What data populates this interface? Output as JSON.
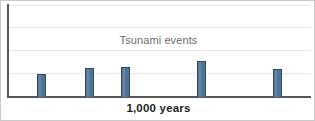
{
  "chart_data": {
    "type": "bar",
    "title": "",
    "annotations": [
      {
        "name": "series-label",
        "text": "Tsunami events"
      }
    ],
    "xlabel": "1,000 years",
    "ylabel": "",
    "grid": true,
    "gridlines_y": [
      4,
      3,
      2,
      1
    ],
    "legend_position": "none",
    "ylim": [
      0,
      4
    ],
    "categories": [
      "1",
      "2",
      "3",
      "4",
      "5"
    ],
    "values": [
      0.98,
      1.24,
      1.28,
      1.55,
      1.22
    ],
    "bars": [
      {
        "label": "event-1",
        "x_px": 36,
        "height_px": 23,
        "value": 0.98
      },
      {
        "label": "event-2",
        "x_px": 84,
        "height_px": 29,
        "value": 1.24
      },
      {
        "label": "event-3",
        "x_px": 120,
        "height_px": 30,
        "value": 1.28
      },
      {
        "label": "event-4",
        "x_px": 196,
        "height_px": 36,
        "value": 1.55
      },
      {
        "label": "event-5",
        "x_px": 272,
        "height_px": 28,
        "value": 1.22
      }
    ],
    "colors": {
      "bar_fill": "#4f7296",
      "bar_border": "#2f4a66",
      "gridline": "#e6e6e6",
      "axis": "#58585a",
      "series_label_text": "#6c6c6e",
      "axis_title_text": "#231f20",
      "background": "#ffffff",
      "frame_border": "#c9c9c9"
    }
  },
  "labels": {
    "series": "Tsunami events",
    "x_axis_title": "1,000 years"
  }
}
